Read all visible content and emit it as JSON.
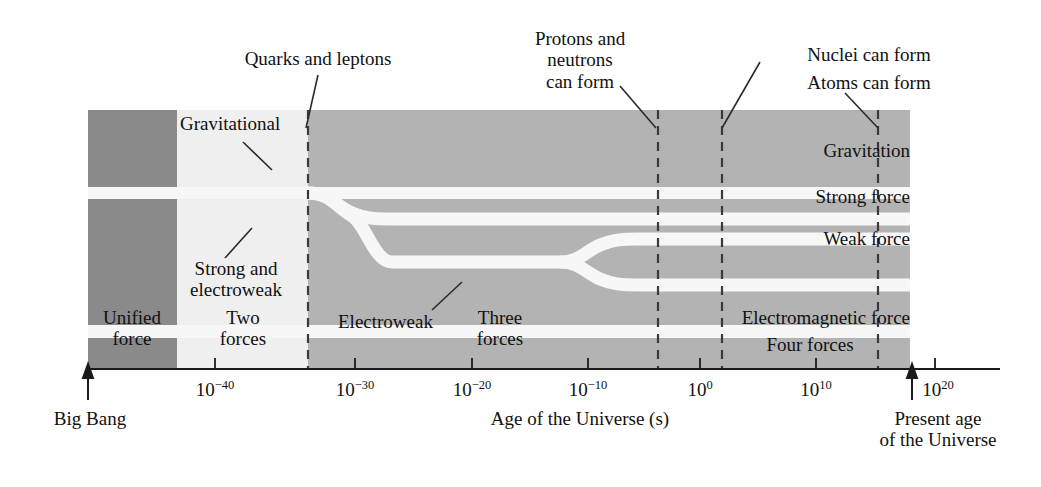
{
  "figure": {
    "axis_title": "Age of the Universe (s)",
    "x_ticks": [
      {
        "base": "10",
        "exp": "−40",
        "x": 215
      },
      {
        "base": "10",
        "exp": "−30",
        "x": 355
      },
      {
        "base": "10",
        "exp": "−20",
        "x": 472
      },
      {
        "base": "10",
        "exp": "−10",
        "x": 588
      },
      {
        "base": "10",
        "exp": "0",
        "x": 700
      },
      {
        "base": "10",
        "exp": "10",
        "x": 816
      },
      {
        "base": "10",
        "exp": "20",
        "x": 935
      }
    ],
    "markers": [
      {
        "label": "Big Bang",
        "x": 88
      },
      {
        "label_line1": "Present age",
        "label_line2": "of the Universe",
        "x": 912
      }
    ],
    "callouts": [
      {
        "name": "quarks-and-leptons",
        "text": "Quarks and leptons",
        "target_x": 308
      },
      {
        "name": "protons-and-neutrons",
        "line1": "Protons and",
        "line2": "neutrons",
        "line3": "can form",
        "target_x": 658
      },
      {
        "name": "nuclei-can-form",
        "text": "Nuclei can form",
        "target_x": 722
      },
      {
        "name": "atoms-can-form",
        "text": "Atoms can form",
        "target_x": 878
      }
    ],
    "inner_callouts": [
      {
        "name": "gravitational",
        "text": "Gravitational"
      },
      {
        "name": "strong-and-electroweak",
        "line1": "Strong and",
        "line2": "electroweak"
      },
      {
        "name": "electroweak-pointer",
        "text": "Electroweak"
      }
    ],
    "band_labels": [
      {
        "name": "gravitation",
        "text": "Gravitation",
        "y": 150
      },
      {
        "name": "strong-force",
        "text": "Strong force",
        "y": 195
      },
      {
        "name": "weak-force",
        "text": "Weak force",
        "y": 238
      },
      {
        "name": "electromagnetic-force",
        "text": "Electromagnetic force",
        "y": 315
      },
      {
        "name": "four-forces",
        "text": "Four forces",
        "y": 342
      }
    ],
    "region_labels": [
      {
        "name": "unified-force",
        "line1": "Unified",
        "line2": "force",
        "x": 132
      },
      {
        "name": "two-forces",
        "line1": "Two",
        "line2": "forces",
        "x": 243
      },
      {
        "name": "three-forces",
        "line1": "Three",
        "line2": "forces",
        "x": 500
      }
    ],
    "colors": {
      "dark_gray": "#8a8a8a",
      "mid_gray": "#b3b3b3",
      "light_gray": "#eeeeee",
      "white_gap": "#f7f7f7",
      "axis": "#1a1a1a",
      "text": "#111111"
    }
  }
}
